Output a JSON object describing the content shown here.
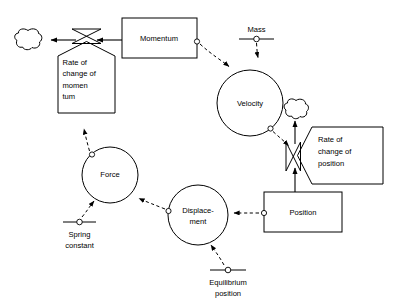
{
  "diagram": {
    "type": "system-dynamics-stock-flow",
    "colors": {
      "stroke": "#000000",
      "background": "#ffffff"
    },
    "stocks": [
      {
        "id": "momentum",
        "label": "Momentum",
        "shape": "rectangle"
      },
      {
        "id": "position",
        "label": "Position",
        "shape": "rectangle"
      }
    ],
    "rates": [
      {
        "id": "rate-of-change-of-momentum",
        "label_lines": [
          "Rate of",
          "change of",
          "momen",
          "tum"
        ],
        "shape": "pentagon-flag-down"
      },
      {
        "id": "rate-of-change-of-position",
        "label_lines": [
          "Rate of",
          "change of",
          "position"
        ],
        "shape": "pentagon-flag-left"
      }
    ],
    "auxiliaries": [
      {
        "id": "velocity",
        "label_lines": [
          "Velocity"
        ],
        "shape": "circle"
      },
      {
        "id": "force",
        "label_lines": [
          "Force"
        ],
        "shape": "circle"
      },
      {
        "id": "displacement",
        "label_lines": [
          "Displace-",
          "ment"
        ],
        "shape": "circle"
      }
    ],
    "parameters": [
      {
        "id": "mass",
        "label_lines": [
          "Mass"
        ],
        "position": "label-above-rule"
      },
      {
        "id": "spring-constant",
        "label_lines": [
          "Spring",
          "constant"
        ],
        "position": "label-below-rule"
      },
      {
        "id": "equilibrium-position",
        "label_lines": [
          "Equilibrium",
          "position"
        ],
        "position": "label-below-rule"
      }
    ],
    "sources_sinks": [
      {
        "id": "cloud-left",
        "label": ""
      },
      {
        "id": "cloud-right",
        "label": ""
      }
    ],
    "valves": [
      {
        "id": "valve-momentum",
        "label": ""
      },
      {
        "id": "valve-position",
        "label": ""
      }
    ],
    "flows": [
      {
        "id": "flow-momentum-out",
        "from": "momentum",
        "to": "cloud-left",
        "style": "solid-arrow"
      },
      {
        "id": "flow-position-out",
        "from": "position",
        "to": "cloud-right",
        "style": "solid-arrow"
      }
    ],
    "information_links": [
      {
        "id": "link-momentum-velocity",
        "from": "momentum",
        "to": "velocity",
        "style": "dashed-arrow"
      },
      {
        "id": "link-mass-velocity",
        "from": "mass",
        "to": "velocity",
        "style": "dashed-arrow"
      },
      {
        "id": "link-velocity-rate-of-change-of-position",
        "from": "velocity",
        "to": "rate-of-change-of-position",
        "style": "dashed-arrow"
      },
      {
        "id": "link-position-displacement",
        "from": "position",
        "to": "displacement",
        "style": "dashed-arrow"
      },
      {
        "id": "link-equilibrium-displacement",
        "from": "equilibrium-position",
        "to": "displacement",
        "style": "dashed-arrow"
      },
      {
        "id": "link-displacement-force",
        "from": "displacement",
        "to": "force",
        "style": "dashed-arrow"
      },
      {
        "id": "link-spring-constant-force",
        "from": "spring-constant",
        "to": "force",
        "style": "dashed-arrow"
      },
      {
        "id": "link-force-rate-of-change-of-momentum",
        "from": "force",
        "to": "rate-of-change-of-momentum",
        "style": "dashed-arrow"
      }
    ]
  }
}
